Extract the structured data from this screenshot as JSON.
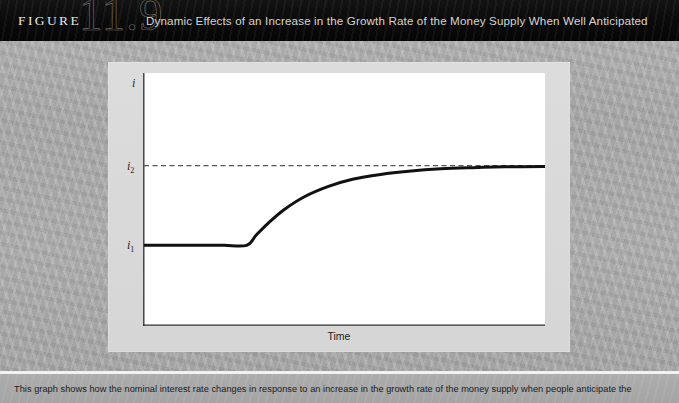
{
  "header": {
    "figure_word": "FIGURE",
    "figure_number": "11.9",
    "title": "Dynamic Effects of an Increase in the Growth Rate of the Money Supply When Well Anticipated",
    "background_color": "#0a0a0a",
    "text_color": "#d7d4cf"
  },
  "panel": {
    "panel_color": "#d8d8d8",
    "plot_color": "#ffffff",
    "page_background_color": "#a9a9a9"
  },
  "chart_data": {
    "type": "line",
    "title": "Dynamic Effects of an Increase in the Growth Rate of the Money Supply When Well Anticipated",
    "xlabel": "Time",
    "ylabel": "i",
    "y_tick_labels": [
      "i₁",
      "i₂"
    ],
    "y_tick_values": [
      1,
      2
    ],
    "ylim": [
      0,
      3
    ],
    "xlim": [
      0,
      10
    ],
    "grid": false,
    "legend": false,
    "axis_origin_label": "i",
    "annotations": [
      {
        "name": "i2-reference-line",
        "type": "dashed-horizontal",
        "y": 2,
        "label": "i₂",
        "color": "#555555"
      },
      {
        "name": "adjustment-start",
        "type": "kink",
        "x": 2.6,
        "y": 1
      }
    ],
    "series": [
      {
        "name": "nominal interest rate path",
        "color": "#111111",
        "line_width": 3,
        "x": [
          0.0,
          0.5,
          1.0,
          1.5,
          2.0,
          2.56,
          2.8,
          3.1,
          3.5,
          4.0,
          4.6,
          5.2,
          5.9,
          6.6,
          7.4,
          8.2,
          9.0,
          10.0
        ],
        "y": [
          1.0,
          1.0,
          1.0,
          1.0,
          1.0,
          1.0,
          1.13,
          1.28,
          1.45,
          1.61,
          1.74,
          1.83,
          1.89,
          1.93,
          1.96,
          1.975,
          1.985,
          1.99
        ]
      }
    ]
  },
  "caption": {
    "text": "This graph shows how the nominal interest rate changes in response to an increase in the growth rate of the money supply when people anticipate the"
  }
}
